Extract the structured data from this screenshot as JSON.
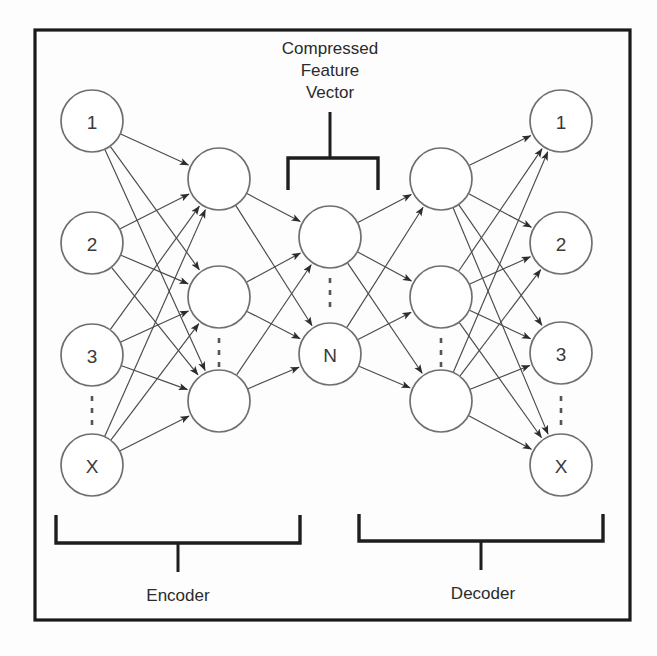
{
  "figure": {
    "kind": "autoencoder-architecture-diagram",
    "frame": {
      "x": 35,
      "y": 30,
      "width": 595,
      "height": 590
    },
    "canvas": {
      "width": 657,
      "height": 656
    }
  },
  "annotations": {
    "compressed_vector_title_lines": [
      "Compressed",
      "Feature",
      "Vector"
    ],
    "encoder_label": "Encoder",
    "decoder_label": "Decoder"
  },
  "layers": [
    {
      "id": "input",
      "name": "input-layer",
      "cx": 92,
      "radius": 31,
      "nodes": [
        {
          "label": "1",
          "cy": 121
        },
        {
          "label": "2",
          "cy": 243
        },
        {
          "label": "3",
          "cy": 355
        },
        {
          "label": "X",
          "cy": 465
        }
      ],
      "ellipsis": {
        "x": 92,
        "y1": 396,
        "y2": 432
      }
    },
    {
      "id": "hidden-encoder",
      "name": "encoder-hidden-layer",
      "cx": 219,
      "radius": 31,
      "nodes": [
        {
          "label": "",
          "cy": 179
        },
        {
          "label": "",
          "cy": 297
        },
        {
          "label": "",
          "cy": 401
        }
      ],
      "ellipsis": {
        "x": 219,
        "y1": 338,
        "y2": 368
      }
    },
    {
      "id": "bottleneck",
      "name": "compressed-feature-vector-layer",
      "cx": 330,
      "radius": 31,
      "nodes": [
        {
          "label": "",
          "cy": 237
        },
        {
          "label": "N",
          "cy": 354
        }
      ],
      "ellipsis": {
        "x": 330,
        "y1": 278,
        "y2": 314
      }
    },
    {
      "id": "hidden-decoder",
      "name": "decoder-hidden-layer",
      "cx": 441,
      "radius": 31,
      "nodes": [
        {
          "label": "",
          "cy": 179
        },
        {
          "label": "",
          "cy": 297
        },
        {
          "label": "",
          "cy": 401
        }
      ],
      "ellipsis": {
        "x": 441,
        "y1": 338,
        "y2": 368
      }
    },
    {
      "id": "output",
      "name": "output-layer",
      "cx": 561,
      "radius": 31,
      "nodes": [
        {
          "label": "1",
          "cy": 121
        },
        {
          "label": "2",
          "cy": 243
        },
        {
          "label": "3",
          "cy": 353
        },
        {
          "label": "X",
          "cy": 465
        }
      ],
      "ellipsis": {
        "x": 561,
        "y1": 396,
        "y2": 432
      }
    }
  ],
  "connections": [
    {
      "from": "input",
      "to": "hidden-encoder"
    },
    {
      "from": "hidden-encoder",
      "to": "bottleneck"
    },
    {
      "from": "bottleneck",
      "to": "hidden-decoder"
    },
    {
      "from": "hidden-decoder",
      "to": "output"
    }
  ],
  "brackets": {
    "compressed": {
      "left_x": 288,
      "right_x": 378,
      "bar_y": 158,
      "stem_bottom_y": 190,
      "stalk_x": 330,
      "stalk_top_y": 112
    },
    "encoder": {
      "left_x": 56,
      "right_x": 300,
      "bar_y": 543,
      "arm_top_y": 515,
      "stalk_x": 178,
      "stalk_bottom_y": 572,
      "label_x": 178,
      "label_y": 601
    },
    "decoder": {
      "left_x": 359,
      "right_x": 603,
      "bar_y": 541,
      "arm_top_y": 514,
      "stalk_x": 481,
      "stalk_bottom_y": 570,
      "label_x": 483,
      "label_y": 599
    }
  },
  "title_position": {
    "x": 330,
    "y_first": 54,
    "line_height": 22
  },
  "colors": {
    "background": "#fdfdfd",
    "frame_stroke": "#1a1a1a",
    "node_stroke": "#6f6f6f",
    "node_fill": "#ffffff",
    "edge_stroke": "#4a4a4a",
    "text": "#2b2b2b",
    "bracket_stroke": "#1e1e1e"
  }
}
